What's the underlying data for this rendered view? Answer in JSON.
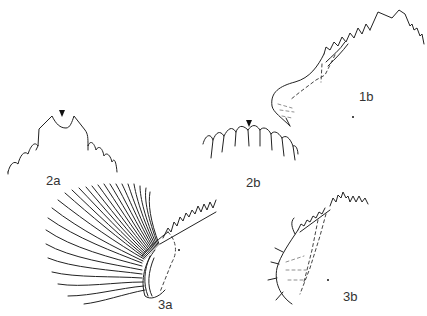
{
  "figure": {
    "panels": [
      {
        "id": "1b",
        "label": "1b",
        "description": "lateral view, serrated structure with dashed inner outlines"
      },
      {
        "id": "2a",
        "label": "2a",
        "description": "serrated edge with central notch, arrowhead marker"
      },
      {
        "id": "2b",
        "label": "2b",
        "description": "arched row of pointed teeth, arrowhead marker"
      },
      {
        "id": "3a",
        "label": "3a",
        "description": "structure with fan of long setae"
      },
      {
        "id": "3b",
        "label": "3b",
        "description": "lateral view with short setae and dashed inner outlines"
      }
    ]
  }
}
